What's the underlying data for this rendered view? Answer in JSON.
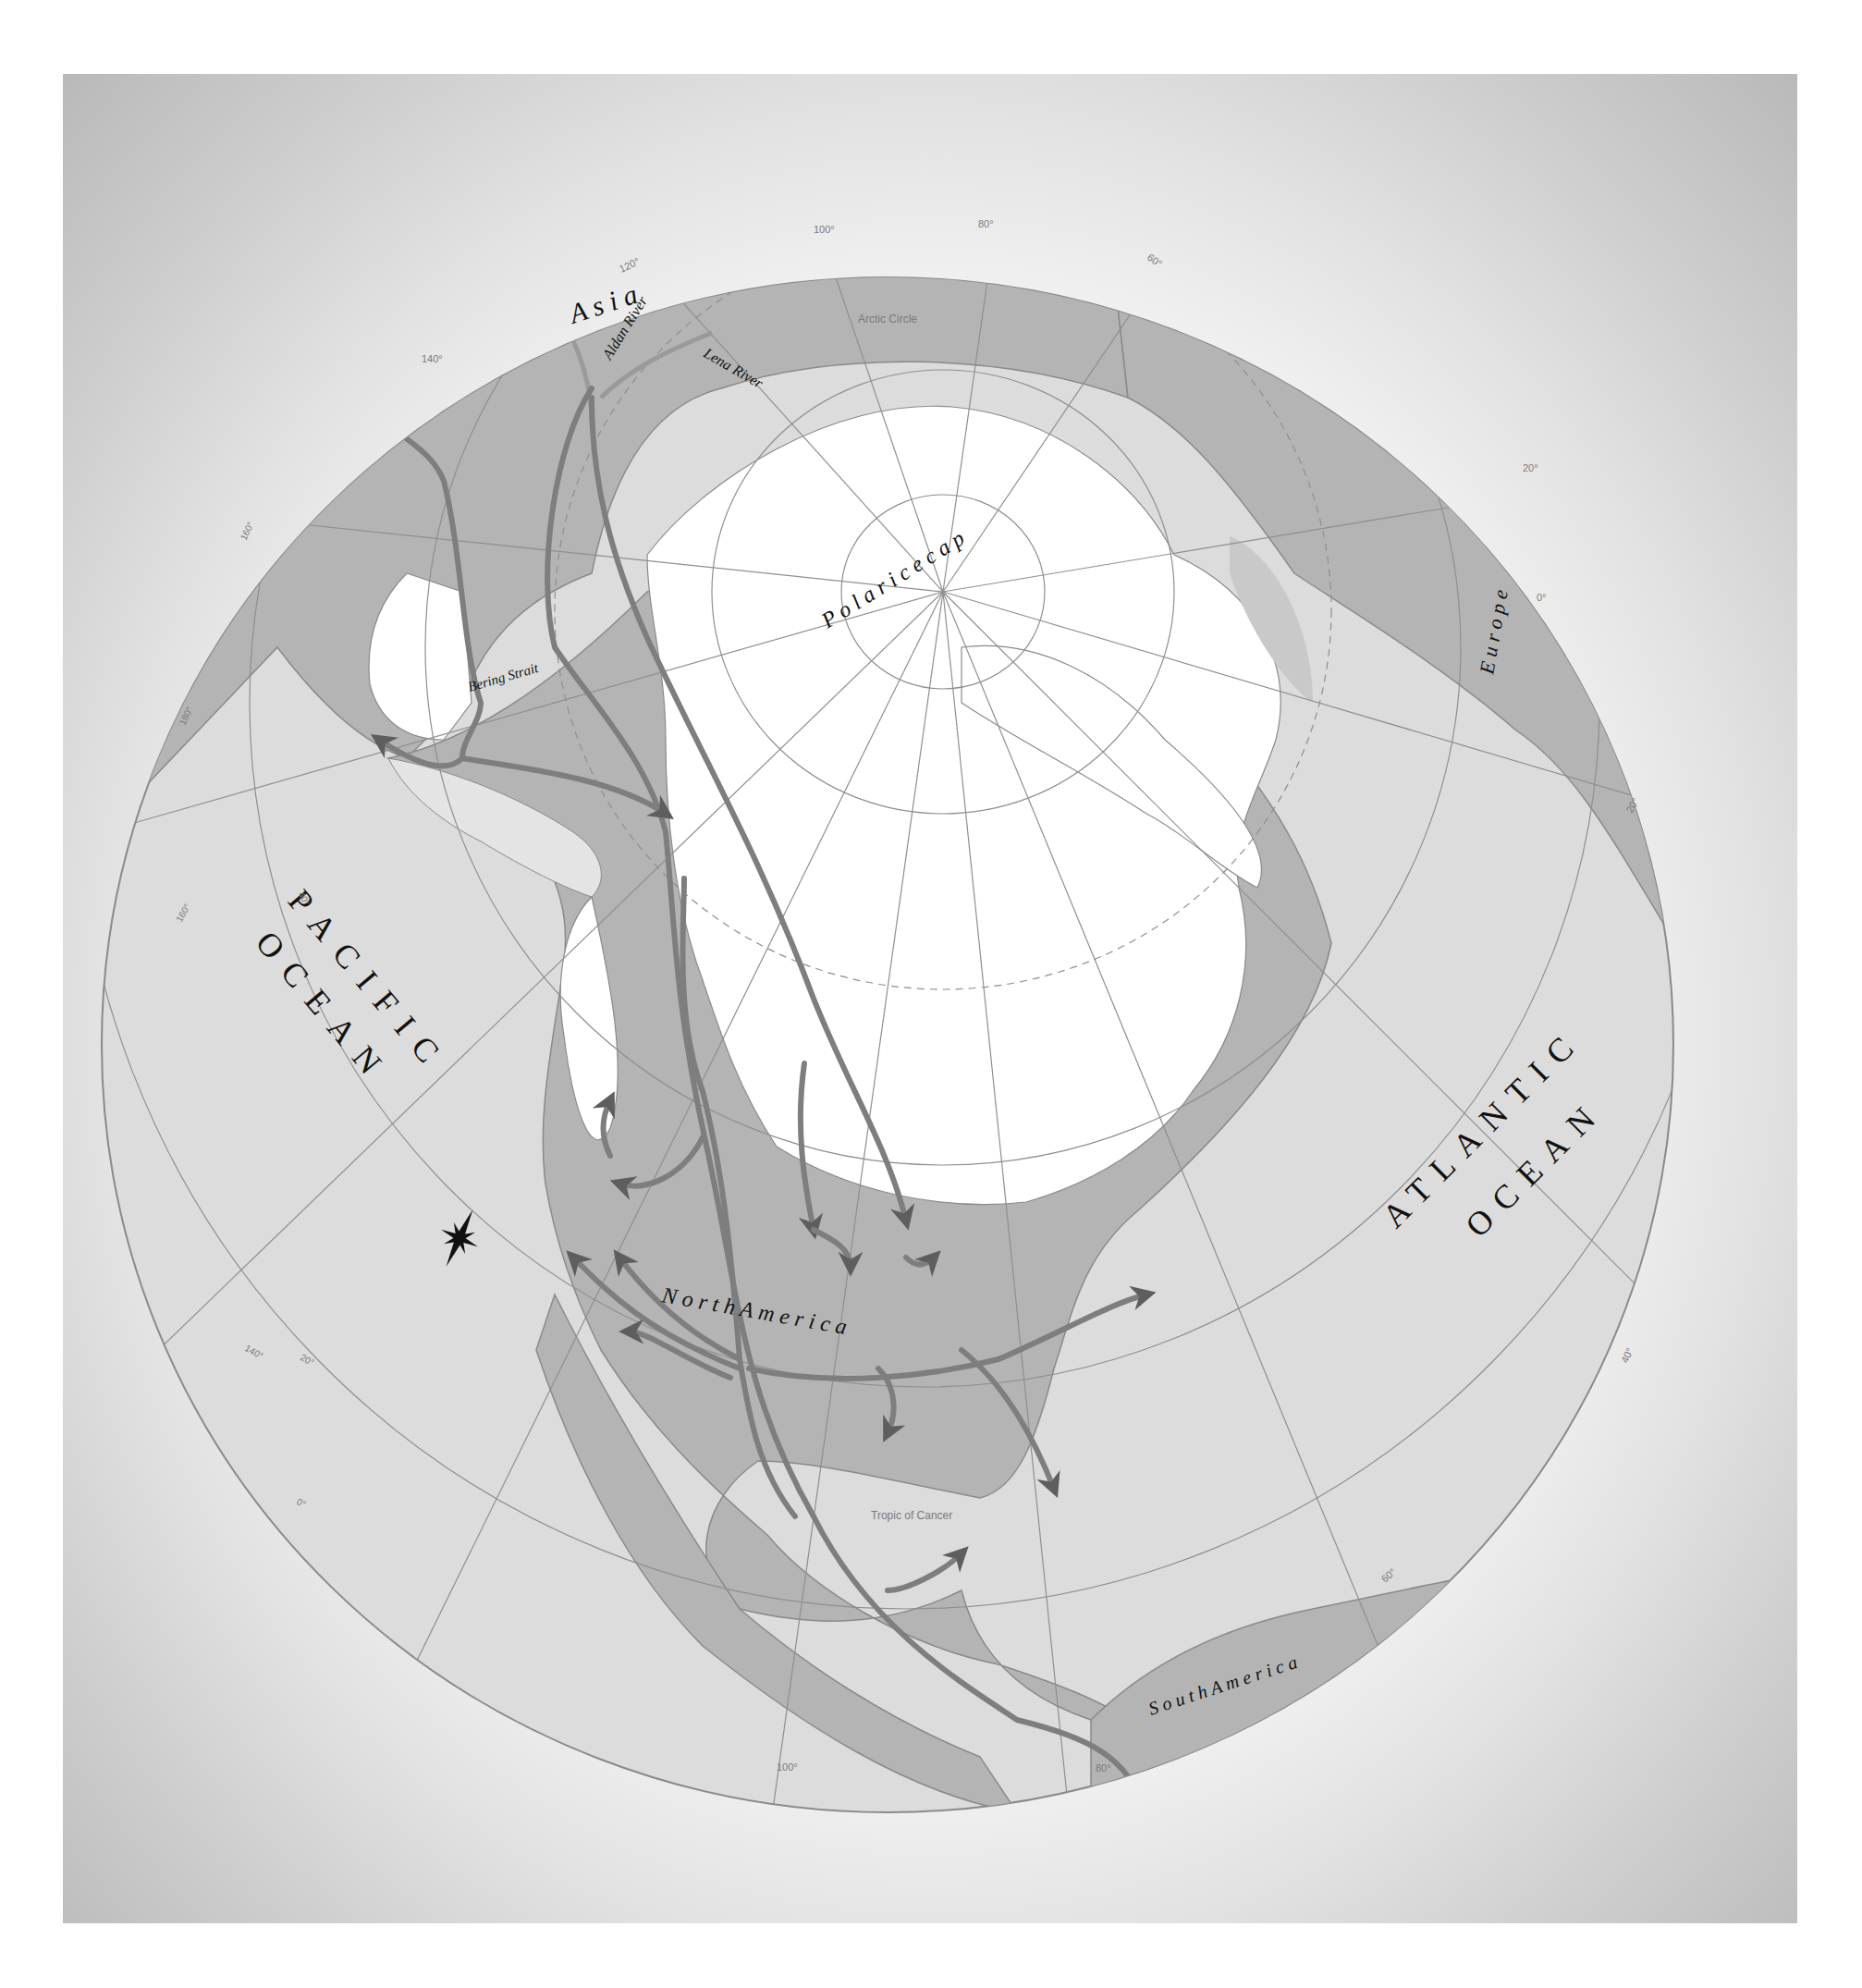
{
  "map": {
    "colors": {
      "ocean": "#dcdcdc",
      "land": "#b4b4b4",
      "ice": "#ffffff",
      "exposed_shelf": "#e4e4e4",
      "route": "#7e7e7e",
      "route_dark": "#5e5e5e",
      "graticule": "#8f8f8f",
      "label": "#111111",
      "grid_label": "#7a7a7a"
    },
    "labels": {
      "asia": "A s i a",
      "europe": "E u r o p e",
      "north_america": "N o r t h   A m e r i c a",
      "south_america": "S o u t h   A m e r i c a",
      "pacific_1": "PACIFIC",
      "pacific_2": "OCEAN",
      "atlantic_1": "ATLANTIC",
      "atlantic_2": "OCEAN",
      "polar_ice_cap": "P o l a r   i c e   c a p",
      "aldan_river": "Aldan River",
      "lena_river": "Lena River",
      "bering_strait": "Bering Strait",
      "arctic_circle": "Arctic Circle",
      "tropic_of_cancer": "Tropic of Cancer"
    },
    "grid_labels": {
      "lon_120": "120°",
      "lon_100_top": "100°",
      "lon_80_top": "80°",
      "lon_60_top": "60°",
      "lon_140_top": "140°",
      "lon_160_left": "160°",
      "lon_180_left": "180°",
      "lat_40_left": "40°",
      "lon_160_lower": "160°",
      "lon_140_lower": "140°",
      "lat_20_lower": "20°",
      "lat_0_lower": "0°",
      "lon_100_bottom": "100°",
      "lon_80_bottom": "80°",
      "lon_60_right": "60°",
      "lat_40_right": "40°",
      "lon_20_europe": "20°",
      "lon_0_europe": "0°",
      "lat_20_right": "20°"
    },
    "compass": "compass-star"
  }
}
